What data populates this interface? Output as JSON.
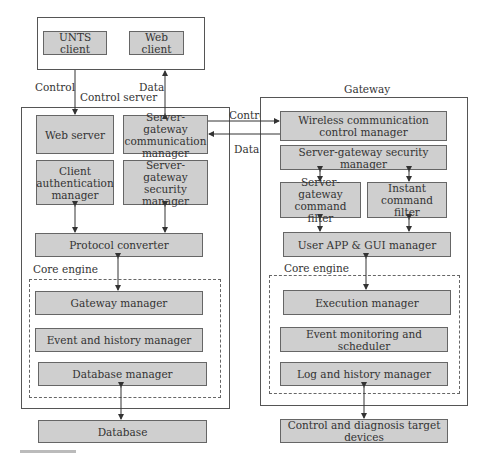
{
  "clients": {
    "unts_client": "UNTS client",
    "web_client": "Web client"
  },
  "links": {
    "control_left": "Control",
    "data_left": "Data",
    "control_mid": "Control",
    "data_mid": "Data"
  },
  "control_server": {
    "title": "Control server",
    "web_server": "Web server",
    "sg_comm_manager": "Server-gateway communication manager",
    "client_auth_manager": "Client authentication manager",
    "sg_security_manager": "Server-gateway security manager",
    "protocol_converter": "Protocol converter",
    "core_engine_label": "Core engine",
    "gateway_manager": "Gateway manager",
    "event_history_manager": "Event and history manager",
    "database_manager": "Database manager"
  },
  "database": "Database",
  "gateway": {
    "title": "Gateway",
    "wireless_manager": "Wireless communication control manager",
    "sg_security_manager": "Server-gateway security manager",
    "sg_command_filter": "Server-gateway command filter",
    "instant_command_filter": "Instant command filter",
    "user_app_gui_manager": "User APP & GUI manager",
    "core_engine_label": "Core engine",
    "execution_manager": "Execution manager",
    "event_monitoring_scheduler": "Event monitoring and scheduler",
    "log_history_manager": "Log and history manager"
  },
  "target_devices": "Control and diagnosis target devices",
  "colors": {
    "box_fill": "#cfcfcf",
    "border": "#666666",
    "background": "#ffffff"
  }
}
